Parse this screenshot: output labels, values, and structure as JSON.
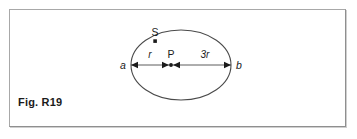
{
  "figure": {
    "caption": "Fig. R19",
    "background_color": "#ffffff",
    "stroke_color": "#3a3a3a",
    "border_color": "#a8a8a8",
    "shape": {
      "name": "ellipse",
      "center_x": 180,
      "center_y": 64,
      "radius_x": 50,
      "radius_y": 35
    },
    "axis": {
      "y": 64,
      "x_start": 130,
      "x_end": 230
    },
    "labels": {
      "point_a": "a",
      "point_b": "b",
      "point_p": "P",
      "point_s": "S",
      "segment_left": "r",
      "segment_right": "3r"
    },
    "points": [
      {
        "name": "a",
        "label": "a",
        "x": 130,
        "y": 64
      },
      {
        "name": "P",
        "label": "P",
        "x": 168,
        "y": 64
      },
      {
        "name": "b",
        "label": "b",
        "x": 230,
        "y": 64
      },
      {
        "name": "S",
        "label": "S",
        "x": 154,
        "y": 38
      }
    ],
    "dimensions": [
      {
        "name": "r-dimension",
        "label": "r",
        "from": "a",
        "to": "P",
        "value": "r"
      },
      {
        "name": "3r-dimension",
        "label": "3r",
        "from": "P",
        "to": "b",
        "value": "3r"
      }
    ]
  }
}
